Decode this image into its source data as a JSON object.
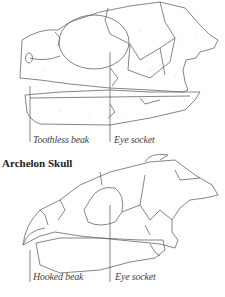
{
  "figure": {
    "top_skull": {
      "labels": {
        "left": "Toothless beak",
        "right": "Eye socket"
      }
    },
    "bottom_skull": {
      "title": "Archelon Skull",
      "labels": {
        "left": "Hooked beak",
        "right": "Eye socket"
      }
    },
    "colors": {
      "line": "#666666",
      "stipple": "#bbbbbb",
      "background": "#ffffff"
    }
  }
}
